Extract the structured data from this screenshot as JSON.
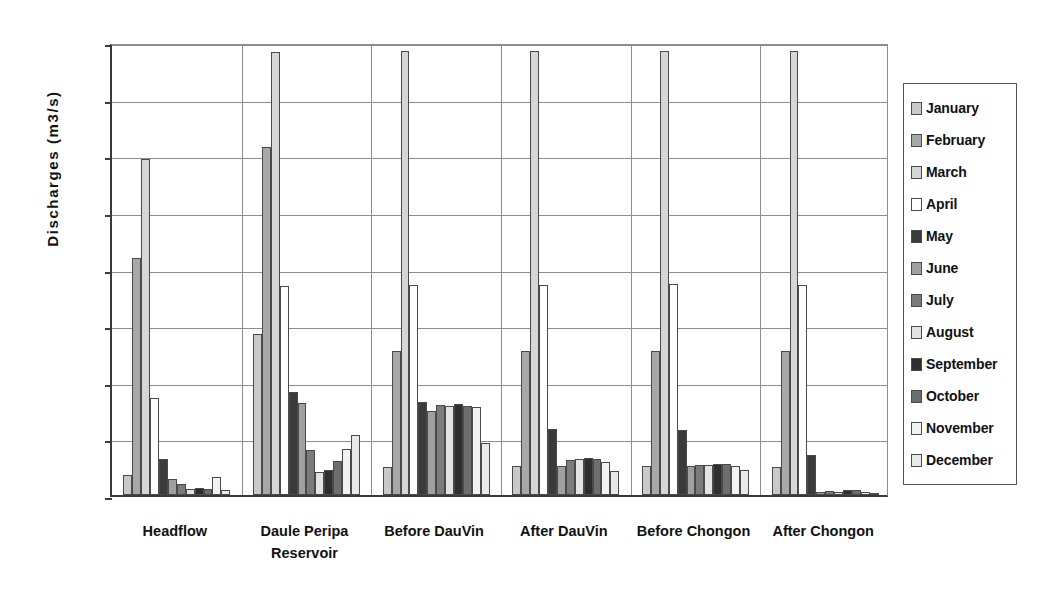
{
  "chart_data": {
    "type": "bar",
    "title": "",
    "subtitle": "",
    "xlabel": "",
    "ylabel": "Discharges (m3/s)",
    "ylim": [
      0,
      800
    ],
    "ytick_values": [
      0,
      100,
      200,
      300,
      400,
      500,
      600,
      700,
      800
    ],
    "ytick_labels": [
      "0",
      "100",
      "200",
      "300",
      "400",
      "500",
      "600",
      "700",
      "800"
    ],
    "grid": "horizontal-and-vertical",
    "legend_position": "right",
    "categories": [
      "Headflow",
      "Daule Peripa\nReservoir",
      "Before DauVin",
      "After DauVin",
      "Before Chongon",
      "After Chongon"
    ],
    "series": [
      {
        "name": "January",
        "color": "#c9c9c9",
        "values": [
          35,
          285,
          50,
          51,
          51,
          50
        ]
      },
      {
        "name": "February",
        "color": "#a8a8a8",
        "values": [
          418,
          614,
          254,
          254,
          254,
          254
        ]
      },
      {
        "name": "March",
        "color": "#d6d6d6",
        "values": [
          594,
          783,
          784,
          785,
          785,
          785
        ]
      },
      {
        "name": "April",
        "color": "#ffffff",
        "values": [
          172,
          370,
          371,
          371,
          372,
          371
        ]
      },
      {
        "name": "May",
        "color": "#3a3a3a",
        "values": [
          63,
          182,
          165,
          117,
          115,
          71
        ]
      },
      {
        "name": "June",
        "color": "#a0a0a0",
        "values": [
          29,
          163,
          148,
          51,
          51,
          6
        ]
      },
      {
        "name": "July",
        "color": "#7b7b7b",
        "values": [
          20,
          79,
          159,
          62,
          53,
          7
        ]
      },
      {
        "name": "August",
        "color": "#e3e3e3",
        "values": [
          11,
          41,
          157,
          63,
          53,
          6
        ]
      },
      {
        "name": "September",
        "color": "#2e2e2e",
        "values": [
          12,
          44,
          160,
          65,
          54,
          8
        ]
      },
      {
        "name": "October",
        "color": "#6e6e6e",
        "values": [
          10,
          60,
          158,
          64,
          54,
          8
        ]
      },
      {
        "name": "November",
        "color": "#f2f2f2",
        "values": [
          32,
          81,
          155,
          58,
          52,
          5
        ]
      },
      {
        "name": "December",
        "color": "#e9e9e9",
        "values": [
          9,
          106,
          91,
          42,
          45,
          4
        ]
      }
    ]
  },
  "axis": {
    "y_title": "Discharges (m3/s)"
  }
}
